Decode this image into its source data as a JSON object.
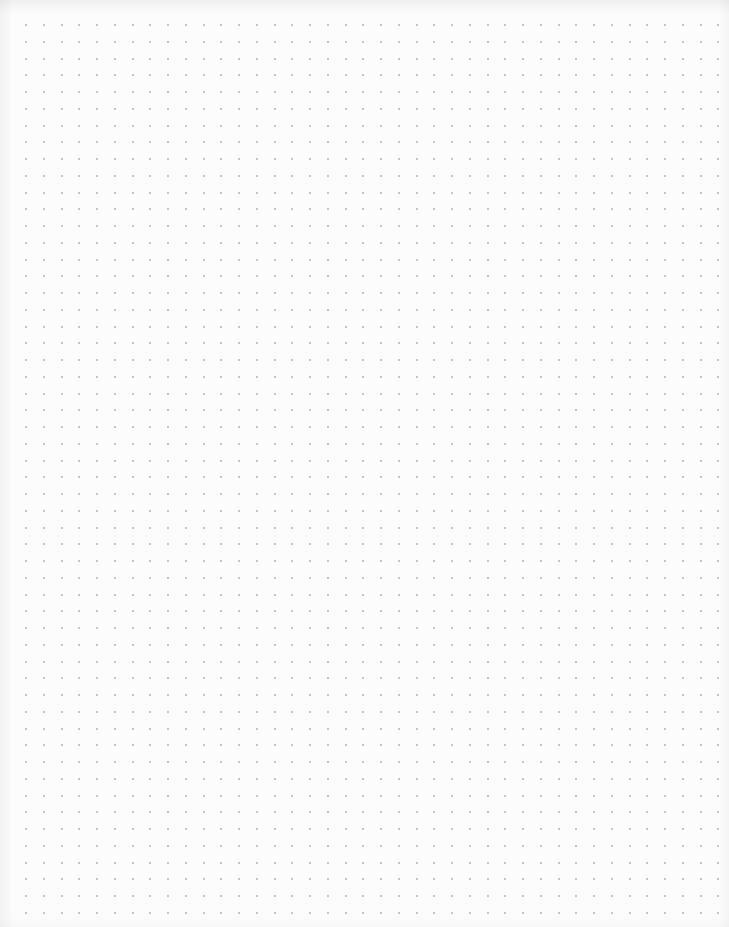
{
  "page": {
    "type": "dot-grid paper",
    "background_color": "#fcfcfc",
    "dot_color": "#b4b4b4"
  },
  "grid": {
    "origin_x": 26,
    "origin_y": 25,
    "pitch_x": 17.75,
    "pitch_y": 16.75,
    "columns": 40,
    "rows": 54,
    "dot_size": 2
  }
}
